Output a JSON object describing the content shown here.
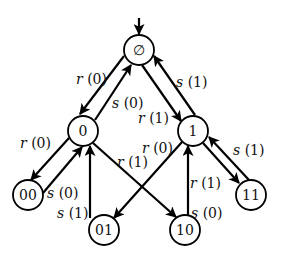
{
  "diagram": {
    "type": "state-transition-tree",
    "colors": {
      "stroke": "#000000",
      "fill": "#ffffff",
      "text": "#111111"
    },
    "start_arrow": {
      "target": "empty"
    },
    "nodes": [
      {
        "id": "empty",
        "label": "∅",
        "x": 139,
        "y": 50,
        "r": 15
      },
      {
        "id": "n0",
        "label": "0",
        "x": 83,
        "y": 131,
        "r": 15
      },
      {
        "id": "n1",
        "label": "1",
        "x": 193,
        "y": 131,
        "r": 15
      },
      {
        "id": "n00",
        "label": "00",
        "x": 28,
        "y": 195,
        "r": 15
      },
      {
        "id": "n01",
        "label": "01",
        "x": 104,
        "y": 230,
        "r": 15
      },
      {
        "id": "n10",
        "label": "10",
        "x": 185,
        "y": 230,
        "r": 15
      },
      {
        "id": "n11",
        "label": "11",
        "x": 251,
        "y": 195,
        "r": 15
      }
    ],
    "edges": [
      {
        "from": "empty",
        "to": "n0",
        "label": "r (0)"
      },
      {
        "from": "n0",
        "to": "empty",
        "label": "s (0)"
      },
      {
        "from": "empty",
        "to": "n1",
        "label": "r (1)"
      },
      {
        "from": "n1",
        "to": "empty",
        "label": "s (1)"
      },
      {
        "from": "n0",
        "to": "n00",
        "label": "r (0)"
      },
      {
        "from": "n00",
        "to": "n0",
        "label": "s (0)"
      },
      {
        "from": "n0",
        "to": "n10",
        "label": "r (1)"
      },
      {
        "from": "n01",
        "to": "n0",
        "label": "s (1)"
      },
      {
        "from": "n1",
        "to": "n01",
        "label": "r (0)"
      },
      {
        "from": "n10",
        "to": "n1",
        "label": "s (0)"
      },
      {
        "from": "n1",
        "to": "n11",
        "label": "r (1)"
      },
      {
        "from": "n11",
        "to": "n1",
        "label": "s (1)"
      }
    ],
    "labels": {
      "e_empty_n0": "r (0)",
      "e_n0_empty": "s (0)",
      "e_empty_n1": "r (1)",
      "e_n1_empty": "s (1)",
      "e_n0_n00": "r (0)",
      "e_n00_n0": "s (0)",
      "e_n0_n10": "r (1)",
      "e_n01_n0": "s (1)",
      "e_n1_n01": "r (0)",
      "e_n10_n1": "s (0)",
      "e_n1_n11": "r (1)",
      "e_n11_n1": "s (1)"
    },
    "node_labels": {
      "empty": "∅",
      "n0": "0",
      "n1": "1",
      "n00": "00",
      "n01": "01",
      "n10": "10",
      "n11": "11"
    }
  }
}
